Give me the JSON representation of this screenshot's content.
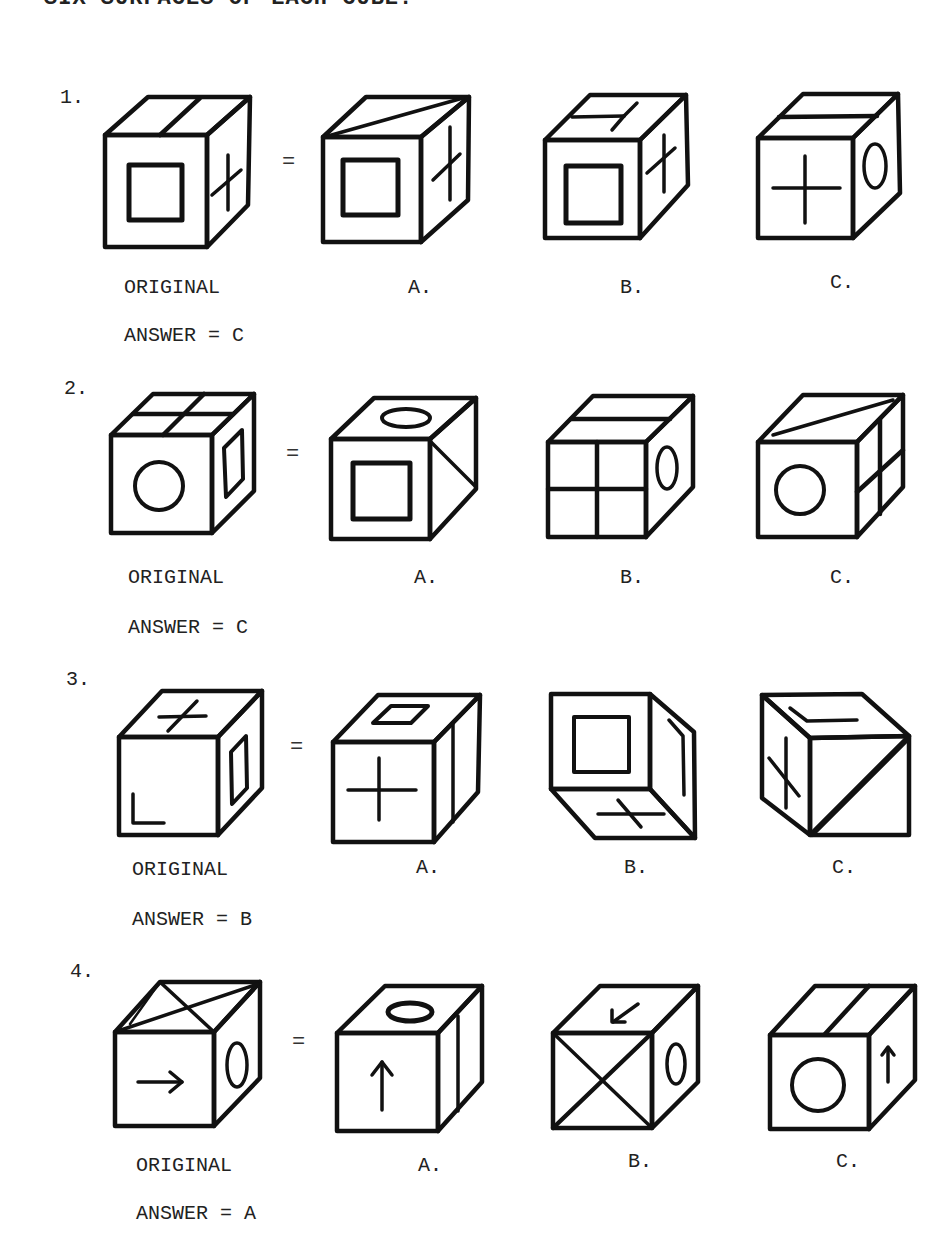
{
  "heading": "SIX SURFACES OF EACH CUBE.",
  "equals_sign": "=",
  "labels": {
    "original": "ORIGINAL",
    "a": "A.",
    "b": "B.",
    "c": "C."
  },
  "questions": [
    {
      "number": "1.",
      "answer_text": "ANSWER = C",
      "answer": "C",
      "cubes": {
        "original": {
          "top": "one-dividing-line",
          "front": "square",
          "right": "plus"
        },
        "a": {
          "top": "diagonal-line",
          "front": "square",
          "right": "plus"
        },
        "b": {
          "top": "t-shape",
          "front": "square",
          "right": "plus"
        },
        "c": {
          "top": "one-dividing-line",
          "front": "plus",
          "right": "oval"
        }
      }
    },
    {
      "number": "2.",
      "answer_text": "ANSWER = C",
      "answer": "C",
      "cubes": {
        "original": {
          "top": "four-quadrants",
          "front": "circle",
          "right": "square"
        },
        "a": {
          "top": "oval",
          "front": "square",
          "right": "triangle"
        },
        "b": {
          "top": "one-dividing-line",
          "front": "four-quadrants",
          "right": "oval"
        },
        "c": {
          "top": "diagonal-line",
          "front": "circle",
          "right": "four-quadrants"
        }
      }
    },
    {
      "number": "3.",
      "answer_text": "ANSWER = B",
      "answer": "B",
      "cubes": {
        "original": {
          "top": "plus",
          "front": "l-shape",
          "right": "square"
        },
        "a": {
          "top": "square",
          "front": "plus",
          "right": "one-dividing-line"
        },
        "b": {
          "front": "square",
          "right": "l-shape",
          "bottom": "plus"
        },
        "c": {
          "top": "l-shape",
          "left": "plus",
          "front": "diagonal-line"
        }
      }
    },
    {
      "number": "4.",
      "answer_text": "ANSWER = A",
      "answer": "A",
      "cubes": {
        "original": {
          "top": "x-triangles",
          "front": "arrow-right",
          "right": "oval"
        },
        "a": {
          "top": "oval",
          "front": "arrow-up",
          "right": "one-dividing-line"
        },
        "b": {
          "top": "arrow-down-left",
          "front": "x-cross",
          "right": "oval"
        },
        "c": {
          "top": "one-dividing-line",
          "front": "circle",
          "right": "arrow-up"
        }
      }
    }
  ]
}
